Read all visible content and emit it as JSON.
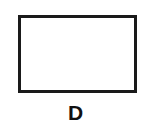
{
  "figure": {
    "shape": "rectangle",
    "label": "D",
    "stroke_color": "#1a1a1a",
    "fill_color": "#ffffff"
  }
}
